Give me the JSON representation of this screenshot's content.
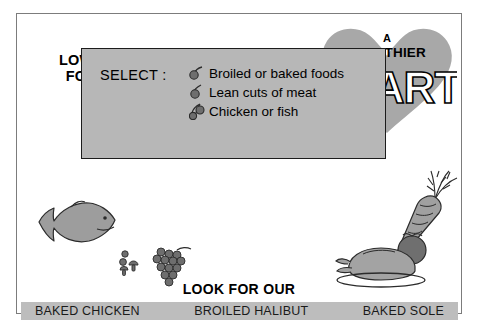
{
  "poster": {
    "equation": {
      "terms": [
        {
          "id": "low-fat-foods",
          "line1": "LOW-FAT",
          "line2": "FOODS"
        },
        {
          "id": "lowered-cholesterol",
          "line1": "LOWERED",
          "line2": "CHOLESTEROL"
        }
      ],
      "operator_1": "=",
      "operator_2": "=",
      "heart": {
        "article": "A",
        "adjective": "HEALTHIER",
        "word": "HEART",
        "fill_color": "#a8a8a8",
        "word_fill": "#ffffff",
        "word_stroke": "#000000"
      }
    },
    "panel": {
      "select_label": "SELECT :",
      "items": [
        "Broiled or baked foods",
        "Lean cuts of meat",
        "Chicken or fish"
      ],
      "background_color": "#b7b7b7",
      "border_color": "#1c1c1c"
    },
    "illustrations": [
      {
        "name": "fish",
        "color": "#9d9d9d"
      },
      {
        "name": "grapes",
        "color": "#6e6e6e"
      },
      {
        "name": "carrot",
        "color": "#a0a0a0"
      },
      {
        "name": "tomato",
        "color": "#6f6f6f"
      },
      {
        "name": "roast-turkey",
        "color": "#a3a3a3"
      }
    ],
    "footer": {
      "headline": "LOOK FOR OUR",
      "band_color": "#bdbdbd",
      "menu_items": [
        "BAKED CHICKEN",
        "BROILED HALIBUT",
        "BAKED SOLE"
      ]
    }
  }
}
